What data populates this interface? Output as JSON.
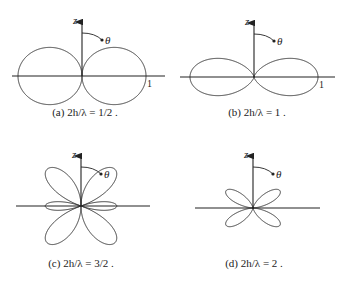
{
  "colors": {
    "line": "#333333",
    "axis": "#222222",
    "background": "#ffffff"
  },
  "chart_data": [
    {
      "type": "polar-line",
      "panel": "a",
      "caption": "(a)  2h/λ = 1/2 .",
      "parameter_2h_over_lambda": 0.5,
      "axis_label_vertical": "z",
      "angle_label": "θ",
      "radial_tick_label": "1",
      "center": [
        82,
        76
      ],
      "scale_px": 64,
      "axis_extent": {
        "left": 12,
        "right": 165,
        "top": 16
      },
      "lobes": "two broadside lobes at θ = 90°",
      "caption_pos": [
        85,
        114
      ]
    },
    {
      "type": "polar-line",
      "panel": "b",
      "caption": "(b)  2h/λ = 1 .",
      "parameter_2h_over_lambda": 1,
      "axis_label_vertical": "z",
      "angle_label": "θ",
      "radial_tick_label": "1",
      "center": [
        254,
        77
      ],
      "scale_px": 64,
      "axis_extent": {
        "left": 180,
        "right": 335,
        "top": 17
      },
      "lobes": "two narrower broadside lobes at θ = 90°",
      "caption_pos": [
        257,
        114
      ]
    },
    {
      "type": "polar-line",
      "panel": "c",
      "caption": "(c)  2h/λ = 3/2 .",
      "parameter_2h_over_lambda": 1.5,
      "axis_label_vertical": "z",
      "angle_label": "θ",
      "radial_tick_label": "",
      "center": [
        81,
        206
      ],
      "scale_px": 50,
      "axis_extent": {
        "left": 16,
        "right": 150,
        "top": 150
      },
      "lobes": "four major lobes near θ ≈ 42° and 138° plus small broadside lobes",
      "caption_pos": [
        81,
        265
      ]
    },
    {
      "type": "polar-line",
      "panel": "d",
      "caption": "(d)  2h/λ = 2 .",
      "parameter_2h_over_lambda": 2,
      "axis_label_vertical": "z",
      "angle_label": "θ",
      "radial_tick_label": "",
      "center": [
        253,
        208
      ],
      "scale_px": 32,
      "axis_extent": {
        "left": 195,
        "right": 320,
        "top": 150
      },
      "lobes": "four lobes near θ ≈ 57° and 123°, null at θ = 90°",
      "caption_pos": [
        254,
        265
      ]
    }
  ]
}
